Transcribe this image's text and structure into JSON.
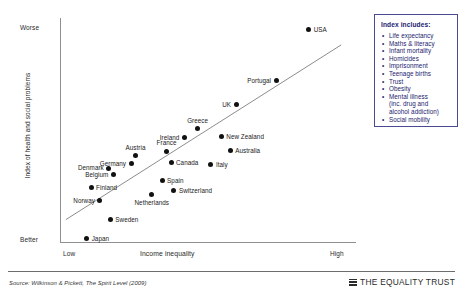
{
  "chart_data": {
    "type": "scatter",
    "title": "",
    "xlabel": "Income inequality",
    "ylabel": "Index of health and social problems",
    "x_ticks": [
      "Low",
      "High"
    ],
    "y_ticks": [
      "Worse",
      "Better"
    ],
    "xlim": [
      0,
      100
    ],
    "ylim": [
      0,
      100
    ],
    "grid": false,
    "trendline": {
      "x0": 2,
      "y0": 10,
      "x1": 95,
      "y1": 88
    },
    "points": [
      {
        "label": "USA",
        "x": 84.0,
        "y": 95.0,
        "label_pos": "right"
      },
      {
        "label": "Portugal",
        "x": 73.0,
        "y": 72.0,
        "label_pos": "left"
      },
      {
        "label": "UK",
        "x": 59.5,
        "y": 61.5,
        "label_pos": "left"
      },
      {
        "label": "Greece",
        "x": 46.5,
        "y": 50.5,
        "label_pos": "above"
      },
      {
        "label": "New Zealand",
        "x": 54.5,
        "y": 47.0,
        "label_pos": "right"
      },
      {
        "label": "Ireland",
        "x": 42.0,
        "y": 46.5,
        "label_pos": "left"
      },
      {
        "label": "Australia",
        "x": 57.5,
        "y": 41.0,
        "label_pos": "right"
      },
      {
        "label": "France",
        "x": 36.0,
        "y": 40.5,
        "label_pos": "above"
      },
      {
        "label": "Austria",
        "x": 25.5,
        "y": 38.5,
        "label_pos": "above"
      },
      {
        "label": "Canada",
        "x": 37.5,
        "y": 35.5,
        "label_pos": "right"
      },
      {
        "label": "Germany",
        "x": 24.0,
        "y": 35.0,
        "label_pos": "left"
      },
      {
        "label": "Italy",
        "x": 51.0,
        "y": 34.5,
        "label_pos": "right"
      },
      {
        "label": "Denmark",
        "x": 16.5,
        "y": 33.0,
        "label_pos": "left"
      },
      {
        "label": "Belgium",
        "x": 18.0,
        "y": 30.0,
        "label_pos": "left"
      },
      {
        "label": "Spain",
        "x": 34.5,
        "y": 27.5,
        "label_pos": "right"
      },
      {
        "label": "Switzerland",
        "x": 38.5,
        "y": 23.0,
        "label_pos": "right"
      },
      {
        "label": "Finland",
        "x": 10.5,
        "y": 24.5,
        "label_pos": "right"
      },
      {
        "label": "Netherlands",
        "x": 31.0,
        "y": 21.0,
        "label_pos": "below"
      },
      {
        "label": "Norway",
        "x": 13.5,
        "y": 18.5,
        "label_pos": "left"
      },
      {
        "label": "Sweden",
        "x": 17.0,
        "y": 10.0,
        "label_pos": "right"
      },
      {
        "label": "Japan",
        "x": 9.0,
        "y": 1.5,
        "label_pos": "right"
      }
    ]
  },
  "legend": {
    "title": "Index includes:",
    "items": [
      "Life expectancy",
      "Maths & literacy",
      "Infant mortality",
      "Homicides",
      "Imprisonment",
      "Teenage births",
      "Trust",
      "Obesity",
      "Mental illness"
    ],
    "sub_lines": [
      "(inc. drug and",
      "alcohol addiction)"
    ],
    "last_item": "Social mobility",
    "bullet": "•",
    "accent": "#1a1a6e"
  },
  "footer": {
    "source": "Source: Wilkinson & Pickett, The Spirit Level (2009)",
    "brand": "THE EQUALITY TRUST"
  }
}
